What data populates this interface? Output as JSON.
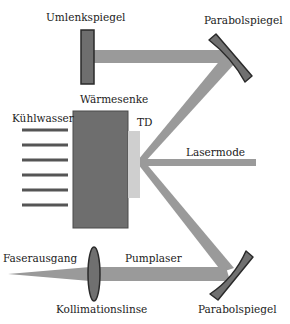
{
  "diagram": {
    "labels": {
      "umlenkspiegel": "Umlenkspiegel",
      "parabolspiegel_top": "Parabolspiegel",
      "waermesenke": "Wärmesenke",
      "kuehlwasser": "Kühlwasser",
      "td": "TD",
      "lasermode": "Lasermode",
      "faserausgang": "Faserausgang",
      "pumplaser": "Pumplaser",
      "kollimationslinse": "Kollimationslinse",
      "parabolspiegel_bottom": "Parabolspiegel"
    },
    "components": [
      {
        "id": "umlenkspiegel",
        "type": "flat-mirror"
      },
      {
        "id": "parabolspiegel-top",
        "type": "parabolic-mirror"
      },
      {
        "id": "waermesenke",
        "type": "heat-sink"
      },
      {
        "id": "td",
        "type": "thin-disk"
      },
      {
        "id": "kuehlwasser",
        "type": "cooling-water",
        "line_count": 6
      },
      {
        "id": "kollimationslinse",
        "type": "lens"
      },
      {
        "id": "faserausgang",
        "type": "fiber-output"
      },
      {
        "id": "parabolspiegel-bottom",
        "type": "parabolic-mirror"
      }
    ],
    "colors": {
      "beam": "#9a9a9a",
      "heat_sink": "#6e6e6e",
      "disk": "#cfcfcf",
      "mirror": "#707070",
      "outline": "#2a2a2a",
      "cooling": "#555555",
      "text": "#222222"
    }
  }
}
